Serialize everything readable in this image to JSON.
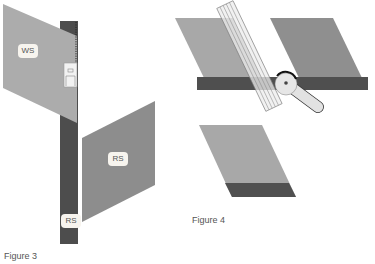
{
  "figures": [
    {
      "caption": "Figure 3",
      "labels": {
        "ws": "WS",
        "rs_panel": "RS",
        "rs_strip": "RS"
      },
      "colors": {
        "light_fabric": "#a9a9a9",
        "dark_fabric": "#8a8a8a",
        "strip": "#4d4d4d",
        "label_bg": "#f7f4ee"
      }
    },
    {
      "caption": "Figure 4",
      "colors": {
        "light_fabric": "#a6a6a6",
        "dark_fabric": "#8c8c8c",
        "bar": "#4f4f4f",
        "ruler": "#eaeaea",
        "tool": "#e4e4e4"
      }
    }
  ]
}
